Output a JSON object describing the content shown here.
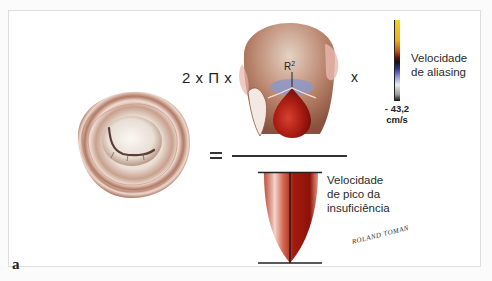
{
  "figure": {
    "panel_label": "a",
    "formula": {
      "prefix": "2 x Π x",
      "times_symbol": "x",
      "equals_symbol": "=",
      "radius_label": "R",
      "radius_superscript": "2"
    },
    "color_scale": {
      "value": "- 43,2",
      "unit": "cm/s",
      "label_line1": "Velocidade",
      "label_line2": "de aliasing",
      "colors": [
        "#f2d21a",
        "#e9a21a",
        "#8a1a10",
        "#121212",
        "#3a3ea8",
        "#9aa0e0",
        "#f4f4f4",
        "#111111"
      ]
    },
    "jet_label": {
      "line1": "Velocidade",
      "line2": "de pico da",
      "line3": "insuficiência"
    },
    "signature": "ROLAND TOMAN",
    "colors": {
      "valve_ring": "#a56f5a",
      "valve_inner": "#efe6dc",
      "jet_red": "#b2200f",
      "pisa_blue": "#8d97c6",
      "text": "#222222",
      "frame_border": "#dedede"
    }
  }
}
